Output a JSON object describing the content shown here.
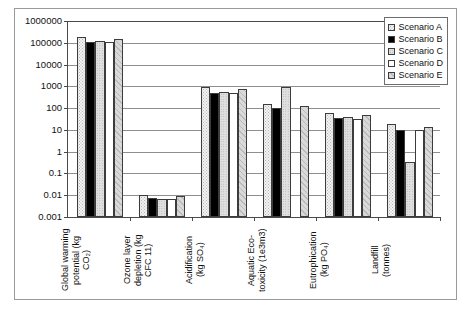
{
  "chart_data": {
    "type": "bar",
    "title": "",
    "xlabel": "",
    "ylabel": "",
    "yscale": "log",
    "ylim": [
      0.001,
      1000000
    ],
    "grid": true,
    "legend_position": "top-right",
    "ytick_labels": [
      "1000000",
      "100000",
      "10000",
      "1000",
      "100",
      "10",
      "1",
      "0.1",
      "0.01",
      "0.001"
    ],
    "ytick_values": [
      1000000,
      100000,
      10000,
      1000,
      100,
      10,
      1,
      0.1,
      0.01,
      0.001
    ],
    "categories": [
      "Global warming potential (kg CO2)",
      "Ozone layer depletion (kg CFC 11)",
      "Acidification (kg SO4)",
      "Aquatic Eco-toxicity (1e3m3)",
      "Eutrophication (kg PO4)",
      "Landfill (tonnes)"
    ],
    "category_labels_display": [
      "Global warming\npotential (kg\nCO₂)",
      "Ozone layer\ndepletion (kg\nCFC 11)",
      "Acidification\n(kg SO₄)",
      "Aquatic Eco-\ntoxicity (1e3m3)",
      "Eutrophication\n(kg PO₄)",
      "Landfill\n(tonnes)"
    ],
    "series": [
      {
        "name": "Scenario A",
        "pattern": "dotted-light",
        "values": [
          180000,
          0.0105,
          900,
          150,
          57,
          18
        ]
      },
      {
        "name": "Scenario B",
        "pattern": "solid-black",
        "values": [
          110000,
          0.0071,
          520,
          105,
          34,
          10
        ]
      },
      {
        "name": "Scenario C",
        "pattern": "fine-dotted-gray",
        "values": [
          125000,
          0.007,
          530,
          950,
          39,
          0.33
        ]
      },
      {
        "name": "Scenario D",
        "pattern": "white",
        "values": [
          105000,
          0.007,
          480,
          0,
          32,
          10
        ]
      },
      {
        "name": "Scenario E",
        "pattern": "diagonal-hatch",
        "values": [
          150000,
          0.0095,
          780,
          130,
          47,
          13
        ]
      }
    ]
  },
  "legend": {
    "entries": [
      {
        "label": "Scenario A"
      },
      {
        "label": "Scenario B"
      },
      {
        "label": "Scenario C"
      },
      {
        "label": "Scenario D"
      },
      {
        "label": "Scenario E"
      }
    ]
  }
}
